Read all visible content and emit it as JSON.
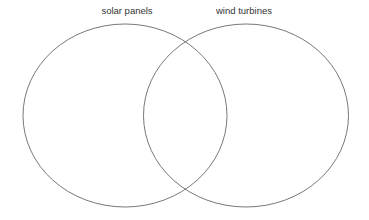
{
  "diagram": {
    "type": "venn",
    "title": "",
    "background_color": "#ffffff",
    "stroke_color": "#555555",
    "text_color": "#333333",
    "sets": [
      {
        "id": "solar-panels",
        "label": "solar panels",
        "label_x": 127,
        "label_y": 14,
        "center_x": 125,
        "center_y": 115.5,
        "radius_x": 102,
        "radius_y": 91.5,
        "items": []
      },
      {
        "id": "wind-turbines",
        "label": "wind turbines",
        "label_x": 244,
        "label_y": 14,
        "center_x": 246,
        "center_y": 115.5,
        "radius_x": 102.5,
        "radius_y": 91.5,
        "items": []
      }
    ],
    "intersection": {
      "id": "solar-panels-and-wind-turbines",
      "label": "",
      "items": []
    }
  }
}
